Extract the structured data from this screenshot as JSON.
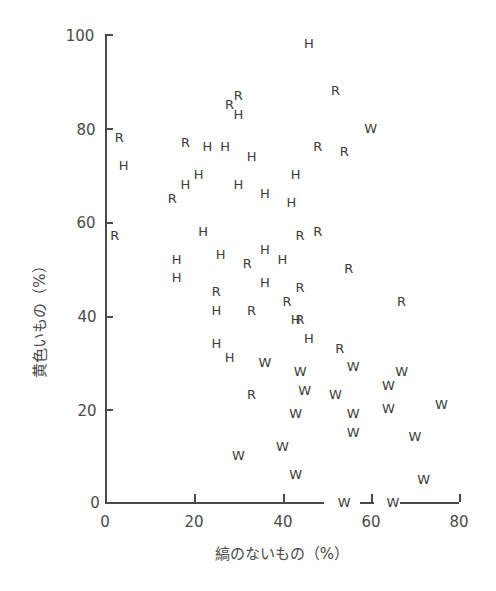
{
  "chart_data": {
    "type": "scatter",
    "title": "",
    "xlabel": "縞のないもの（%）",
    "ylabel": "黄色いもの（%）",
    "xlim": [
      0,
      80
    ],
    "ylim": [
      0,
      100
    ],
    "xticks": [
      0,
      20,
      40,
      60,
      80
    ],
    "yticks": [
      0,
      20,
      40,
      60,
      80,
      100
    ],
    "grid": false,
    "legend": null,
    "marker_style": "letters",
    "series": [
      {
        "name": "H",
        "points": [
          [
            46,
            98
          ],
          [
            30,
            83
          ],
          [
            4,
            72
          ],
          [
            23,
            76
          ],
          [
            27,
            76
          ],
          [
            33,
            74
          ],
          [
            21,
            70
          ],
          [
            18,
            68
          ],
          [
            30,
            68
          ],
          [
            36,
            66
          ],
          [
            43,
            70
          ],
          [
            42,
            64
          ],
          [
            22,
            58
          ],
          [
            36,
            54
          ],
          [
            40,
            52
          ],
          [
            16,
            52
          ],
          [
            26,
            53
          ],
          [
            16,
            48
          ],
          [
            36,
            47
          ],
          [
            25,
            41
          ],
          [
            25,
            34
          ],
          [
            43,
            39
          ],
          [
            46,
            35
          ],
          [
            28,
            31
          ]
        ]
      },
      {
        "name": "R",
        "points": [
          [
            3,
            78
          ],
          [
            18,
            77
          ],
          [
            15,
            65
          ],
          [
            28,
            85
          ],
          [
            30,
            87
          ],
          [
            52,
            88
          ],
          [
            48,
            76
          ],
          [
            54,
            75
          ],
          [
            44,
            57
          ],
          [
            48,
            58
          ],
          [
            2,
            57
          ],
          [
            32,
            51
          ],
          [
            55,
            50
          ],
          [
            25,
            45
          ],
          [
            41,
            43
          ],
          [
            44,
            46
          ],
          [
            33,
            41
          ],
          [
            44,
            39
          ],
          [
            53,
            33
          ],
          [
            67,
            43
          ],
          [
            33,
            23
          ]
        ]
      },
      {
        "name": "W",
        "points": [
          [
            60,
            80
          ],
          [
            36,
            30
          ],
          [
            44,
            28
          ],
          [
            45,
            24
          ],
          [
            56,
            29
          ],
          [
            67,
            28
          ],
          [
            64,
            25
          ],
          [
            52,
            23
          ],
          [
            56,
            19
          ],
          [
            56,
            15
          ],
          [
            64,
            20
          ],
          [
            76,
            21
          ],
          [
            43,
            19
          ],
          [
            70,
            14
          ],
          [
            40,
            12
          ],
          [
            30,
            10
          ],
          [
            43,
            6
          ],
          [
            72,
            5
          ],
          [
            54,
            0
          ],
          [
            65,
            0
          ]
        ]
      }
    ]
  },
  "axis": {
    "x_tick_labels": [
      "0",
      "20",
      "40",
      "60",
      "80"
    ],
    "y_tick_labels": [
      "0",
      "20",
      "40",
      "60",
      "80",
      "100"
    ],
    "x_title": "縞のないもの（%）",
    "y_title": "黄色いもの（%）"
  },
  "caption": "…による…縞なし黄色……（一部切れて判読不可）"
}
